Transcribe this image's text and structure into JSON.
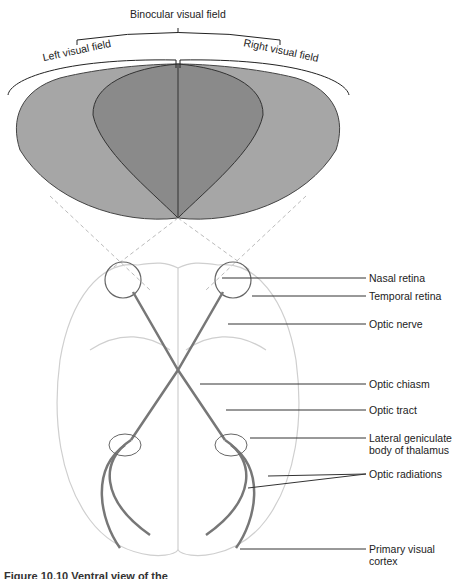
{
  "diagram": {
    "title_labels": {
      "binocular": "Binocular visual field",
      "left": "Left visual field",
      "right": "Right visual field"
    },
    "labels": [
      {
        "id": "nasal-retina",
        "text": "Nasal retina"
      },
      {
        "id": "temporal-retina",
        "text": "Temporal retina"
      },
      {
        "id": "optic-nerve",
        "text": "Optic nerve"
      },
      {
        "id": "optic-chiasm",
        "text": "Optic chiasm"
      },
      {
        "id": "optic-tract",
        "text": "Optic tract"
      },
      {
        "id": "lateral-geniculate",
        "text": "Lateral geniculate",
        "text2": "body of thalamus"
      },
      {
        "id": "optic-radiations",
        "text": "Optic radiations"
      },
      {
        "id": "primary-visual-cortex",
        "text": "Primary visual",
        "text2": "cortex"
      }
    ],
    "caption": "Figure 10.10 Ventral view of the",
    "colors": {
      "monocular_field": "#a6a6a6",
      "binocular_field": "#8c8c8c",
      "pathway": "#777777",
      "brain_outline": "#cccccc",
      "leader_line": "#333333"
    }
  }
}
